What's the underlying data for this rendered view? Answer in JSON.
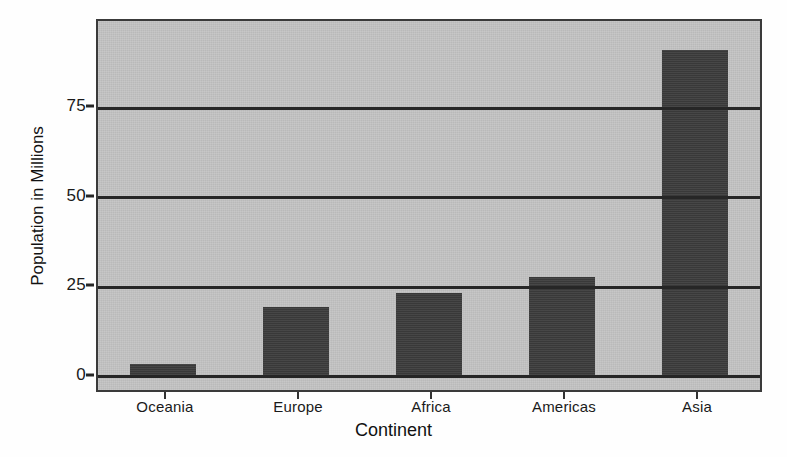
{
  "chart_data": {
    "type": "bar",
    "title": "",
    "xlabel": "Continent",
    "ylabel": "Population in Millions",
    "categories": [
      "Oceania",
      "Europe",
      "Africa",
      "Americas",
      "Asia"
    ],
    "values": [
      3,
      19,
      23,
      27.5,
      91
    ],
    "series": [
      {
        "name": "Population in Millions",
        "values": [
          3,
          19,
          23,
          27.5,
          91
        ]
      }
    ],
    "ylim": [
      0,
      99
    ],
    "yticks": [
      0,
      25,
      50,
      75
    ],
    "ytick_labels": [
      "0",
      "25",
      "50",
      "75"
    ],
    "grid": true,
    "grid_axis": "y",
    "legend": false,
    "legend_position": "none",
    "bar_color": "#3d3d3d",
    "panel_color": "#c3c3c3",
    "axis_color": "#262626",
    "figure_background": "#fefefe"
  }
}
